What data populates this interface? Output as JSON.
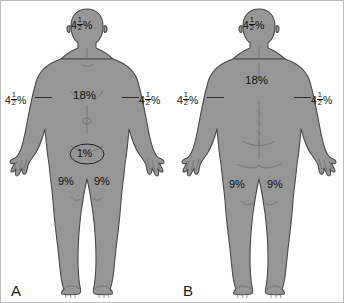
{
  "image": {
    "title": "Rule of Nines burn surface area chart",
    "background_color": "#ffffff",
    "body_fill_color": "#969696",
    "outline_color": "#4a4a4a",
    "text_color": "#111111"
  },
  "panels": [
    {
      "id": "A",
      "letter": "A",
      "view": "anterior",
      "labels": {
        "head": {
          "whole": "4",
          "num": "1",
          "den": "2",
          "pct": "%",
          "text": "4 1/2 %"
        },
        "arm_left": {
          "whole": "4",
          "num": "1",
          "den": "2",
          "pct": "%",
          "text": "4 1/2 %"
        },
        "arm_right": {
          "whole": "4",
          "num": "1",
          "den": "2",
          "pct": "%",
          "text": "4 1/2 %"
        },
        "trunk": {
          "text": "18%"
        },
        "genitalia": {
          "text": "1%"
        },
        "leg_left": {
          "text": "9%"
        },
        "leg_right": {
          "text": "9%"
        }
      }
    },
    {
      "id": "B",
      "letter": "B",
      "view": "posterior",
      "labels": {
        "head": {
          "whole": "4",
          "num": "1",
          "den": "2",
          "pct": "%",
          "text": "4 1/2 %"
        },
        "arm_left": {
          "whole": "4",
          "num": "1",
          "den": "2",
          "pct": "%",
          "text": "4 1/2 %"
        },
        "arm_right": {
          "whole": "4",
          "num": "1",
          "den": "2",
          "pct": "%",
          "text": "4 1/2 %"
        },
        "trunk": {
          "text": "18%"
        },
        "leg_left": {
          "text": "9%"
        },
        "leg_right": {
          "text": "9%"
        }
      }
    }
  ]
}
